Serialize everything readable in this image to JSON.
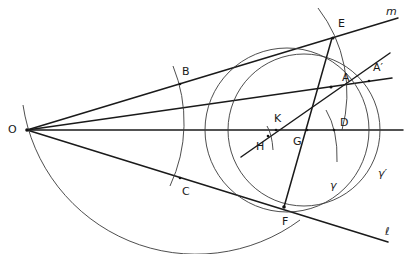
{
  "diagram": {
    "type": "geometric-construction",
    "labels": {
      "O": "O",
      "B": "B",
      "C": "C",
      "E": "E",
      "F": "F",
      "A": "A",
      "A_prime": "A′",
      "K": "K",
      "H": "H",
      "G": "G",
      "D": "D",
      "gamma": "γ",
      "gamma_prime": "γ′",
      "m": "m",
      "l": "ℓ"
    },
    "colors": {
      "stroke": "#1a1a1a",
      "background": "#ffffff"
    }
  }
}
